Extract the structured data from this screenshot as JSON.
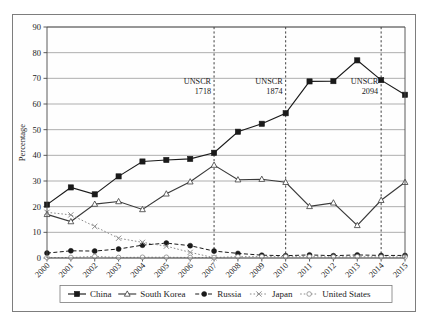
{
  "figure": {
    "background_color": "#ffffff",
    "frame_color": "#7d7d7d"
  },
  "chart_data": {
    "type": "line",
    "title": "",
    "subtitle": "",
    "xlabel": "",
    "ylabel": "Percentage",
    "x": [
      2000,
      2001,
      2002,
      2003,
      2004,
      2005,
      2006,
      2007,
      2008,
      2009,
      2010,
      2011,
      2012,
      2013,
      2014,
      2015
    ],
    "categories": [
      "2000",
      "2001",
      "2002",
      "2003",
      "2004",
      "2005",
      "2006",
      "2007",
      "2008",
      "2009",
      "2010",
      "2011",
      "2012",
      "2013",
      "2014",
      "2015"
    ],
    "xlim": [
      2000,
      2015
    ],
    "ylim": [
      0,
      90
    ],
    "yticks": [
      0,
      10,
      20,
      30,
      40,
      50,
      60,
      70,
      80,
      90
    ],
    "ytick_labels": [
      "0",
      "10",
      "20",
      "30",
      "40",
      "50",
      "60",
      "70",
      "80",
      "90"
    ],
    "grid": "horizontal",
    "legend_position": "bottom",
    "series": [
      {
        "name": "China",
        "marker": "filled-square",
        "line_style": "solid",
        "color": "#1a1a1a",
        "values": [
          20.8,
          27.5,
          24.8,
          31.8,
          37.6,
          38.2,
          38.6,
          41.0,
          49.2,
          52.3,
          56.4,
          68.8,
          68.9,
          77.0,
          69.3,
          63.6
        ]
      },
      {
        "name": "South Korea",
        "marker": "open-triangle",
        "line_style": "solid",
        "color": "#3a3a3a",
        "values": [
          17.0,
          14.2,
          21.0,
          22.0,
          18.9,
          25.0,
          29.7,
          36.2,
          30.5,
          30.7,
          29.5,
          20.1,
          21.5,
          12.7,
          22.5,
          29.5
        ]
      },
      {
        "name": "Russia",
        "marker": "filled-circle",
        "line_style": "dashed",
        "color": "#1a1a1a",
        "values": [
          1.9,
          2.8,
          2.7,
          3.5,
          5.0,
          5.8,
          4.8,
          2.7,
          1.8,
          1.1,
          0.9,
          1.2,
          0.9,
          1.2,
          1.0,
          1.0
        ]
      },
      {
        "name": "Japan",
        "marker": "cross",
        "line_style": "dotted",
        "color": "#8a8a8a",
        "values": [
          17.8,
          16.8,
          12.3,
          7.7,
          6.1,
          4.6,
          2.2,
          0.1,
          null,
          null,
          null,
          null,
          null,
          null,
          null,
          null
        ]
      },
      {
        "name": "United States",
        "marker": "open-circle",
        "line_style": "dotted",
        "color": "#8a8a8a",
        "values": [
          0.2,
          0.2,
          0.6,
          0.2,
          0.3,
          0.3,
          0.2,
          0.2,
          0.5,
          0.5,
          0.5,
          0.5,
          0.4,
          0.5,
          0.4,
          0.4
        ]
      }
    ],
    "annotations": [
      {
        "label_line1": "UNSCR",
        "label_line2": "1718",
        "x": 2007
      },
      {
        "label_line1": "UNSCR",
        "label_line2": "1874",
        "x": 2010
      },
      {
        "label_line1": "UNSCR",
        "label_line2": "2094",
        "x": 2014
      }
    ]
  }
}
